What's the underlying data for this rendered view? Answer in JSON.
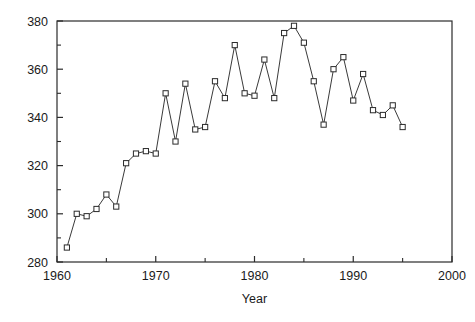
{
  "chart_data": {
    "type": "line",
    "title": "",
    "subtitle": "",
    "xlabel": "Year",
    "ylabel": "",
    "xlim": [
      1960,
      2000
    ],
    "ylim": [
      280,
      380
    ],
    "grid": false,
    "legend": null,
    "marker": "open-square",
    "x_ticks_major": [
      1960,
      1970,
      1980,
      1990,
      2000
    ],
    "x_tick_labels": [
      "1960",
      "1970",
      "1980",
      "1990",
      "2000"
    ],
    "x_ticks_minor": [
      1965,
      1975,
      1985,
      1995
    ],
    "y_ticks_major": [
      280,
      300,
      320,
      340,
      360,
      380
    ],
    "y_tick_labels": [
      "280",
      "300",
      "320",
      "340",
      "360",
      "380"
    ],
    "y_ticks_minor": [
      290,
      310,
      330,
      350,
      370
    ],
    "x": [
      1961,
      1962,
      1963,
      1964,
      1965,
      1966,
      1967,
      1968,
      1969,
      1970,
      1971,
      1972,
      1973,
      1974,
      1975,
      1976,
      1977,
      1978,
      1979,
      1980,
      1981,
      1982,
      1983,
      1984,
      1985,
      1986,
      1987,
      1988,
      1989,
      1990,
      1991,
      1992,
      1993,
      1994,
      1995
    ],
    "values": [
      286,
      300,
      299,
      302,
      308,
      303,
      321,
      325,
      326,
      325,
      350,
      330,
      354,
      335,
      336,
      355,
      348,
      370,
      350,
      349,
      364,
      348,
      375,
      378,
      371,
      355,
      337,
      360,
      365,
      347,
      358,
      343,
      341,
      345,
      336
    ],
    "series": [
      {
        "name": "series-1",
        "values": [
          286,
          300,
          299,
          302,
          308,
          303,
          321,
          325,
          326,
          325,
          350,
          330,
          354,
          335,
          336,
          355,
          348,
          370,
          350,
          349,
          364,
          348,
          375,
          378,
          371,
          355,
          337,
          360,
          365,
          347,
          358,
          343,
          341,
          345,
          336
        ]
      }
    ]
  },
  "figure": {
    "x_axis_title": "Year",
    "y_axis_title": "",
    "accent_color": "#2b2b2b",
    "marker_fill": "#ffffff",
    "background_color": "#ffffff"
  }
}
